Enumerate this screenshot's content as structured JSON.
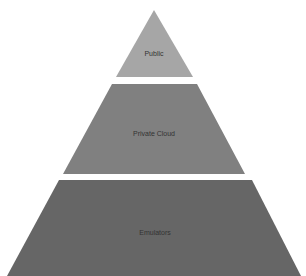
{
  "figure": {
    "title_clipped": true,
    "title_text": ""
  },
  "pyramid": {
    "tiers": [
      {
        "label": "Public",
        "color": "#a6a6a6",
        "level": "top"
      },
      {
        "label": "Private Cloud",
        "color": "#808080",
        "level": "middle"
      },
      {
        "label": "Emulators",
        "color": "#666666",
        "level": "bottom"
      }
    ],
    "separator_color": "#ffffff"
  }
}
